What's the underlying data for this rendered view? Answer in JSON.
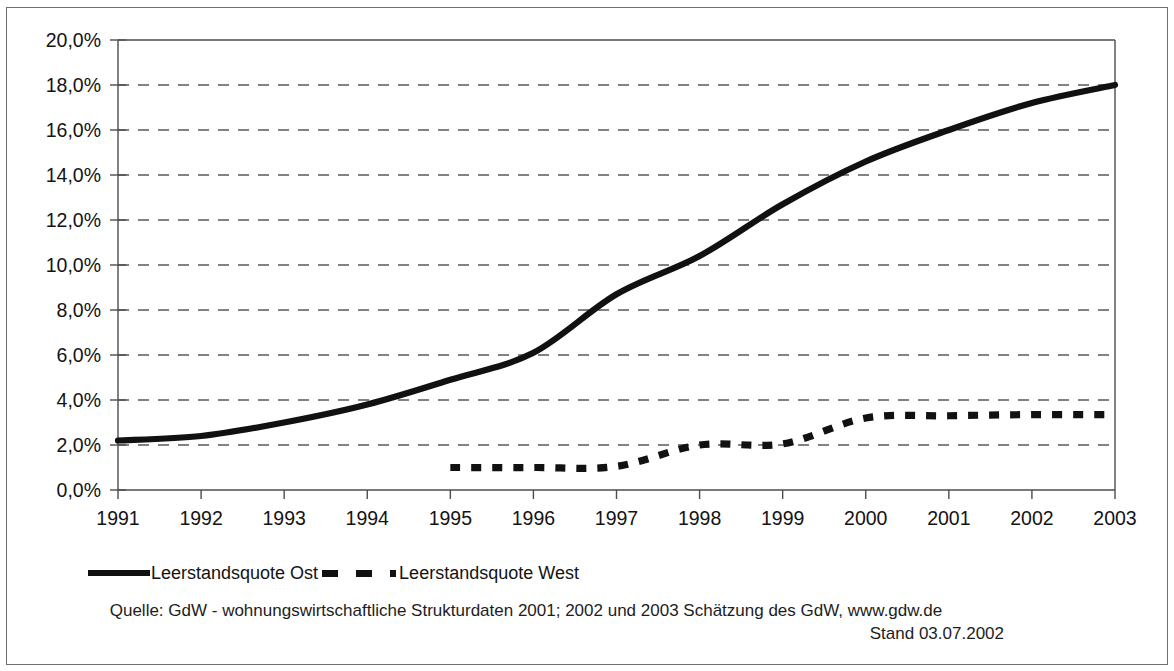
{
  "chart_data": {
    "type": "line",
    "title": "",
    "subtitle": "",
    "xlabel": "",
    "ylabel": "",
    "x": [
      1991,
      1992,
      1993,
      1994,
      1995,
      1996,
      1997,
      1998,
      1999,
      2000,
      2001,
      2002,
      2003
    ],
    "categories": [
      "1991",
      "1992",
      "1993",
      "1994",
      "1995",
      "1996",
      "1997",
      "1998",
      "1999",
      "2000",
      "2001",
      "2002",
      "2003"
    ],
    "xlim": [
      1991,
      2003
    ],
    "ylim": [
      0,
      20
    ],
    "y_tick_values": [
      0,
      2,
      4,
      6,
      8,
      10,
      12,
      14,
      16,
      18,
      20
    ],
    "y_tick_labels": [
      "0,0%",
      "2,0%",
      "4,0%",
      "6,0%",
      "8,0%",
      "10,0%",
      "12,0%",
      "14,0%",
      "16,0%",
      "18,0%",
      "20,0%"
    ],
    "x_tick_labels": [
      "1991",
      "1992",
      "1993",
      "1994",
      "1995",
      "1996",
      "1997",
      "1998",
      "1999",
      "2000",
      "2001",
      "2002",
      "2003"
    ],
    "grid": "horizontal-dashed",
    "legend_position": "bottom-left",
    "series": [
      {
        "name": "Leerstandsquote Ost",
        "style": "solid",
        "color": "#111111",
        "x": [
          1991,
          1992,
          1993,
          1994,
          1995,
          1996,
          1997,
          1998,
          1999,
          2000,
          2001,
          2002,
          2003
        ],
        "values": [
          2.2,
          2.4,
          3.0,
          3.8,
          4.9,
          6.1,
          8.7,
          10.4,
          12.7,
          14.6,
          16.0,
          17.2,
          18.0
        ]
      },
      {
        "name": "Leerstandsquote West",
        "style": "dashed",
        "color": "#111111",
        "x": [
          1995,
          1996,
          1997,
          1998,
          1999,
          2000,
          2001,
          2002,
          2003
        ],
        "values": [
          1.0,
          1.0,
          1.05,
          2.0,
          2.05,
          3.2,
          3.3,
          3.35,
          3.35
        ]
      }
    ]
  },
  "legend": {
    "entries": [
      {
        "label": "Leerstandsquote Ost",
        "style": "solid"
      },
      {
        "label": "Leerstandsquote West",
        "style": "dashed"
      }
    ]
  },
  "source": {
    "line1": "Quelle: GdW - wohnungswirtschaftliche Strukturdaten 2001; 2002 und 2003 Schätzung des GdW, www.gdw.de",
    "line2": "Stand 03.07.2002"
  },
  "colors": {
    "series_ink": "#111111",
    "axis": "#4d4d4d",
    "grid": "#5a5a5a",
    "frame": "#6f6f6f",
    "background": "#ffffff"
  }
}
